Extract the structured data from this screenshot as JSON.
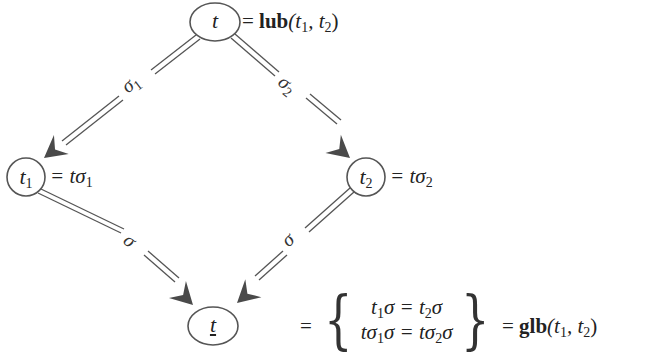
{
  "diagram": {
    "nodes": {
      "top": {
        "label": "t",
        "annotation_eq": "=",
        "annotation_fn": "lub",
        "annotation_args": "(t",
        "annotation_sub1": "1",
        "annotation_mid": ", t",
        "annotation_sub2": "2",
        "annotation_close": ")"
      },
      "left": {
        "label": "t",
        "label_sub": "1",
        "annotation": "= tσ",
        "annotation_sub": "1"
      },
      "right": {
        "label": "t",
        "label_sub": "2",
        "annotation": "= tσ",
        "annotation_sub": "2"
      },
      "bottom": {
        "label": "t",
        "underlined": true
      }
    },
    "edges": [
      {
        "from": "top",
        "to": "left",
        "label": "σ",
        "label_sub": "1",
        "style": "double-arrow"
      },
      {
        "from": "top",
        "to": "right",
        "label": "σ",
        "label_sub": "2",
        "style": "double-arrow"
      },
      {
        "from": "left",
        "to": "bottom",
        "label": "σ",
        "style": "double-arrow"
      },
      {
        "from": "right",
        "to": "bottom",
        "label": "σ",
        "style": "double-arrow"
      }
    ],
    "bottom_equation": {
      "eq": "=",
      "row1": {
        "a": "t",
        "a_sub": "1",
        "b": "σ = t",
        "b_sub": "2",
        "c": "σ"
      },
      "row2": {
        "a": "tσ",
        "a_sub": "1",
        "b": "σ = tσ",
        "b_sub": "2",
        "c": "σ"
      },
      "eq2": "=",
      "fn": "glb",
      "args_open": "(t",
      "sub1": "1",
      "mid": ", t",
      "sub2": "2",
      "close": ")"
    },
    "colors": {
      "stroke": "#555555",
      "arrowhead": "#4a4a4a",
      "text": "#222222",
      "background": "#ffffff"
    }
  }
}
